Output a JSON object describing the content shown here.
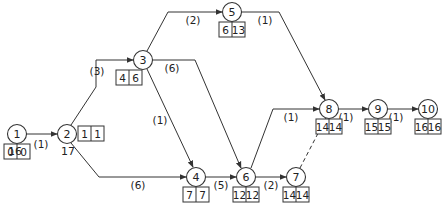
{
  "diagram": {
    "type": "activity-on-node network (critical path)",
    "nodes": [
      {
        "id": "1",
        "label": "1",
        "x": 17,
        "y": 134,
        "box": {
          "x": 4,
          "y": 144,
          "es": "0",
          "ls": "0"
        }
      },
      {
        "id": "2",
        "label": "2",
        "x": 67,
        "y": 134,
        "box": {
          "x": 78,
          "y": 126,
          "es": "1",
          "ls": "1"
        }
      },
      {
        "id": "3",
        "label": "3",
        "x": 143,
        "y": 60,
        "box": {
          "x": 116,
          "y": 70,
          "es": "4",
          "ls": "6"
        }
      },
      {
        "id": "4",
        "label": "4",
        "x": 196,
        "y": 177,
        "box": {
          "x": 183,
          "y": 187,
          "es": "7",
          "ls": "7"
        }
      },
      {
        "id": "5",
        "label": "5",
        "x": 232,
        "y": 12,
        "box": {
          "x": 219,
          "y": 22,
          "es": "6",
          "ls": "13"
        }
      },
      {
        "id": "6",
        "label": "6",
        "x": 246,
        "y": 177,
        "box": {
          "x": 233,
          "y": 187,
          "es": "12",
          "ls": "12"
        }
      },
      {
        "id": "7",
        "label": "7",
        "x": 296,
        "y": 177,
        "box": {
          "x": 283,
          "y": 187,
          "es": "14",
          "ls": "14"
        }
      },
      {
        "id": "8",
        "label": "8",
        "x": 329,
        "y": 109,
        "box": {
          "x": 316,
          "y": 119,
          "es": "14",
          "ls": "14"
        }
      },
      {
        "id": "9",
        "label": "9",
        "x": 378,
        "y": 109,
        "box": {
          "x": 365,
          "y": 119,
          "es": "15",
          "ls": "15"
        }
      },
      {
        "id": "10",
        "label": "10",
        "x": 428,
        "y": 109,
        "box": {
          "x": 415,
          "y": 119,
          "es": "16",
          "ls": "16"
        }
      }
    ],
    "edges": [
      {
        "from": "1",
        "to": "2",
        "label": "(1)",
        "dashed": false,
        "path": "M26,134 L57,134",
        "lx": 41,
        "ly": 144
      },
      {
        "from": "2",
        "to": "3",
        "label": "(3)",
        "dashed": false,
        "path": "M71,125 L96,87 L96,60 L133,60",
        "lx": 97,
        "ly": 71
      },
      {
        "from": "2",
        "to": "4",
        "label": "(6)",
        "dashed": false,
        "path": "M71,143 L99,177 L186,177",
        "lx": 138,
        "ly": 185
      },
      {
        "from": "3",
        "to": "5",
        "label": "(2)",
        "dashed": false,
        "path": "M147,51 L168,12 L222,12",
        "lx": 193,
        "ly": 20
      },
      {
        "from": "3",
        "to": "6",
        "label": "(6)",
        "dashed": false,
        "path": "M153,60 L195,60 L241,168",
        "lx": 172,
        "ly": 68
      },
      {
        "from": "3",
        "to": "4",
        "label": "(1)",
        "dashed": false,
        "path": "M147,69 L193,167",
        "lx": 160,
        "ly": 120
      },
      {
        "from": "5",
        "to": "8",
        "label": "(1)",
        "dashed": false,
        "path": "M242,12 L279,12 L325,100",
        "lx": 265,
        "ly": 20
      },
      {
        "from": "4",
        "to": "6",
        "label": "(5)",
        "dashed": false,
        "path": "M206,177 L236,177",
        "lx": 221,
        "ly": 185
      },
      {
        "from": "6",
        "to": "8",
        "label": "(1)",
        "dashed": false,
        "path": "M251,168 L273,109 L319,109",
        "lx": 291,
        "ly": 117
      },
      {
        "from": "6",
        "to": "7",
        "label": "(2)",
        "dashed": false,
        "path": "M256,177 L286,177",
        "lx": 271,
        "ly": 185
      },
      {
        "from": "7",
        "to": "8",
        "label": "",
        "dashed": true,
        "path": "M300,168 L326,118",
        "lx": 0,
        "ly": 0
      },
      {
        "from": "8",
        "to": "9",
        "label": "(1)",
        "dashed": false,
        "path": "M339,109 L368,109",
        "lx": 346,
        "ly": 117
      },
      {
        "from": "9",
        "to": "10",
        "label": "(1)",
        "dashed": false,
        "path": "M388,109 L418,109",
        "lx": 396,
        "ly": 117
      }
    ],
    "notes": [
      {
        "text": "16",
        "x": 15,
        "y": 151
      },
      {
        "text": "17",
        "x": 68,
        "y": 151
      }
    ]
  }
}
